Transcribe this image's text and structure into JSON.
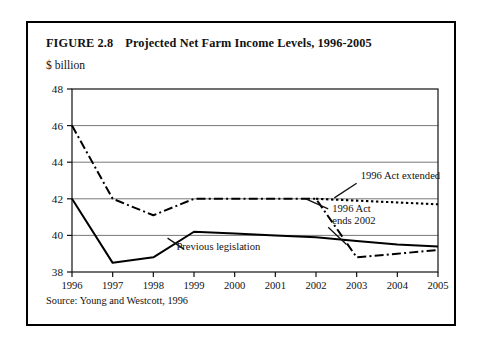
{
  "figure": {
    "number": "FIGURE 2.8",
    "title": "Projected Net Farm Income Levels, 1996-2005",
    "unit_label": "$ billion",
    "source": "Source: Young and Westcott, 1996"
  },
  "chart_data": {
    "type": "line",
    "title": "Projected Net Farm Income Levels, 1996-2005",
    "xlabel": "",
    "ylabel": "$ billion",
    "x": [
      1996,
      1997,
      1998,
      1999,
      2000,
      2001,
      2002,
      2003,
      2004,
      2005
    ],
    "categories": [
      "1996",
      "1997",
      "1998",
      "1999",
      "2000",
      "2001",
      "2002",
      "2003",
      "2004",
      "2005"
    ],
    "xlim": [
      1996,
      2005
    ],
    "ylim": [
      38,
      48
    ],
    "yticks": [
      38,
      40,
      42,
      44,
      46,
      48
    ],
    "xticks": [
      "1996",
      "1997",
      "1998",
      "1999",
      "2000",
      "2001",
      "2002",
      "2003",
      "2004",
      "2005"
    ],
    "grid": true,
    "grid_axis": "y",
    "legend": "none",
    "series": [
      {
        "name": "1996 Act ends 2002",
        "style": "dash-dot",
        "color": "#000000",
        "values": [
          46.0,
          42.0,
          41.1,
          42.0,
          42.0,
          42.0,
          42.0,
          38.8,
          39.0,
          39.2
        ]
      },
      {
        "name": "1996 Act extended",
        "style": "dotted",
        "color": "#000000",
        "values": [
          null,
          null,
          null,
          null,
          null,
          null,
          42.0,
          41.9,
          41.8,
          41.7
        ]
      },
      {
        "name": "Previous legislation",
        "style": "solid",
        "color": "#000000",
        "values": [
          42.0,
          38.5,
          38.8,
          40.2,
          40.1,
          40.0,
          39.9,
          39.7,
          39.5,
          39.4
        ]
      }
    ],
    "annotations": [
      {
        "text": "1996 Act extended",
        "x": 2003.1,
        "y": 43.1
      },
      {
        "text": "1996 Act",
        "x": 2002.4,
        "y": 41.3
      },
      {
        "text": "ends 2002",
        "x": 2002.4,
        "y": 40.6
      },
      {
        "text": "Previous legislation",
        "x": 1999.6,
        "y": 39.2
      }
    ]
  }
}
